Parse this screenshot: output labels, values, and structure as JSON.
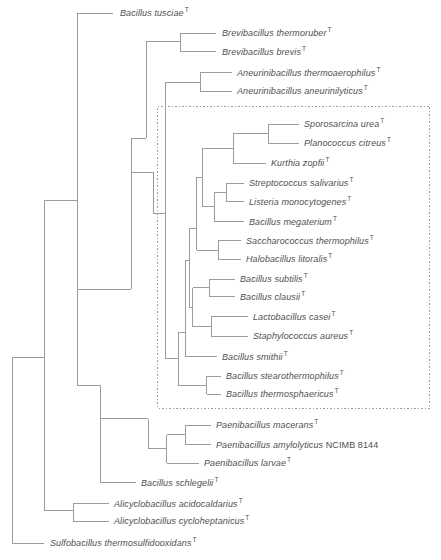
{
  "figure": {
    "colors": {
      "background": "#ffffff",
      "line": "#9c9c9c",
      "text": "#4f4f4f",
      "box_border": "#9c9c9c"
    },
    "highlight_box": {
      "x": 157.5,
      "y": 106,
      "width": 272,
      "height": 302,
      "style": "dotted"
    },
    "taxa": [
      {
        "label": "Bacillus tusciae",
        "type_marker": "T",
        "x": 120,
        "y": 13
      },
      {
        "label": "Brevibacillus thermoruber",
        "type_marker": "T",
        "x": 222,
        "y": 33
      },
      {
        "label": "Brevibacillus brevis",
        "type_marker": "T",
        "x": 222,
        "y": 51.7
      },
      {
        "label": "Aneurinibacillus thermoaerophilus",
        "type_marker": "T",
        "x": 237,
        "y": 72.7
      },
      {
        "label": "Aneurinibacillus aneurinilyticus",
        "type_marker": "T",
        "x": 237,
        "y": 91
      },
      {
        "label": "Sporosarcina urea",
        "type_marker": "T",
        "x": 304,
        "y": 124
      },
      {
        "label": "Planococcus citreus",
        "type_marker": "T",
        "x": 304,
        "y": 143
      },
      {
        "label": "Kurthia zopfii",
        "type_marker": "T",
        "x": 271,
        "y": 163
      },
      {
        "label": "Streptococcus salivarius",
        "type_marker": "T",
        "x": 249,
        "y": 183
      },
      {
        "label": "Listeria monocytogenes",
        "type_marker": "T",
        "x": 249,
        "y": 201.7
      },
      {
        "label": "Bacillus megaterium",
        "type_marker": "T",
        "x": 249,
        "y": 221.7
      },
      {
        "label": "Saccharococcus thermophilus",
        "type_marker": "T",
        "x": 246,
        "y": 240.7
      },
      {
        "label": "Halobacillus litoralis",
        "type_marker": "T",
        "x": 246,
        "y": 259.3
      },
      {
        "label": "Bacillus subtilis",
        "type_marker": "T",
        "x": 240,
        "y": 279
      },
      {
        "label": "Bacillus clausii",
        "type_marker": "T",
        "x": 240,
        "y": 296.7
      },
      {
        "label": "Lactobacillus casei",
        "type_marker": "T",
        "x": 253,
        "y": 316.7
      },
      {
        "label": "Staphylococcus aureus",
        "type_marker": "T",
        "x": 253,
        "y": 336
      },
      {
        "label": "Bacillus smithii",
        "type_marker": "T",
        "x": 222,
        "y": 356.7
      },
      {
        "label": "Bacillus stearothermophilus",
        "type_marker": "T",
        "x": 226,
        "y": 376
      },
      {
        "label": "Bacillus thermosphaericus",
        "type_marker": "T",
        "x": 226,
        "y": 394
      },
      {
        "label": "Paenibacillus macerans",
        "type_marker": "T",
        "x": 216,
        "y": 425
      },
      {
        "label": "Paenibacillus amylolyticus",
        "strain": "NCIMB 8144",
        "type_marker": "",
        "x": 216,
        "y": 444.7
      },
      {
        "label": "Paenibacillus larvae",
        "type_marker": "T",
        "x": 204,
        "y": 463
      },
      {
        "label": "Bacillus schlegelii",
        "type_marker": "T",
        "x": 141,
        "y": 482.7
      },
      {
        "label": "Alicyclobacillus acidocaldarius",
        "type_marker": "T",
        "x": 114,
        "y": 503.7
      },
      {
        "label": "Alicyclobacillus cycloheptanicus",
        "type_marker": "T",
        "x": 114,
        "y": 521
      },
      {
        "label": "Sulfobacillus thermosulfidooxidans",
        "type_marker": "T",
        "x": 50,
        "y": 543
      }
    ],
    "tree": {
      "verticals": [
        {
          "x": 12,
          "y1": 357.5,
          "y2": 543
        },
        {
          "x": 44,
          "y1": 200,
          "y2": 510.5
        },
        {
          "x": 77,
          "y1": 13,
          "y2": 385.3
        },
        {
          "x": 180,
          "y1": 33,
          "y2": 51.7
        },
        {
          "x": 146,
          "y1": 41,
          "y2": 138
        },
        {
          "x": 131,
          "y1": 138,
          "y2": 289
        },
        {
          "x": 153.3,
          "y1": 172,
          "y2": 213.3
        },
        {
          "x": 200,
          "y1": 72.7,
          "y2": 91
        },
        {
          "x": 165,
          "y1": 82,
          "y2": 358.7
        },
        {
          "x": 268,
          "y1": 124,
          "y2": 143
        },
        {
          "x": 233,
          "y1": 133.5,
          "y2": 163
        },
        {
          "x": 202.7,
          "y1": 148.3,
          "y2": 206.7
        },
        {
          "x": 226.7,
          "y1": 183,
          "y2": 201.7
        },
        {
          "x": 214.7,
          "y1": 192.3,
          "y2": 221.7
        },
        {
          "x": 196.5,
          "y1": 177.3,
          "y2": 250
        },
        {
          "x": 218.3,
          "y1": 240.7,
          "y2": 259.3
        },
        {
          "x": 189,
          "y1": 228.3,
          "y2": 307.3
        },
        {
          "x": 209.7,
          "y1": 279,
          "y2": 296.7
        },
        {
          "x": 192.5,
          "y1": 287.7,
          "y2": 326.7
        },
        {
          "x": 211.3,
          "y1": 316.7,
          "y2": 336
        },
        {
          "x": 185,
          "y1": 260,
          "y2": 356.7
        },
        {
          "x": 178.3,
          "y1": 332,
          "y2": 385
        },
        {
          "x": 206.7,
          "y1": 376,
          "y2": 394
        },
        {
          "x": 100,
          "y1": 385.3,
          "y2": 482.7
        },
        {
          "x": 148.3,
          "y1": 418.7,
          "y2": 448.7
        },
        {
          "x": 166.7,
          "y1": 434.7,
          "y2": 463
        },
        {
          "x": 185,
          "y1": 425,
          "y2": 444.7
        },
        {
          "x": 73,
          "y1": 503.7,
          "y2": 521
        }
      ],
      "horizontals": [
        {
          "y": 13,
          "x1": 77,
          "x2": 113
        },
        {
          "y": 200,
          "x1": 44,
          "x2": 77
        },
        {
          "y": 357.5,
          "x1": 12,
          "x2": 44
        },
        {
          "y": 543,
          "x1": 12,
          "x2": 44
        },
        {
          "y": 510.5,
          "x1": 44,
          "x2": 73
        },
        {
          "y": 503.7,
          "x1": 73,
          "x2": 109
        },
        {
          "y": 521,
          "x1": 73,
          "x2": 109
        },
        {
          "y": 41,
          "x1": 146,
          "x2": 180
        },
        {
          "y": 33,
          "x1": 180,
          "x2": 216
        },
        {
          "y": 51.7,
          "x1": 180,
          "x2": 216
        },
        {
          "y": 138,
          "x1": 131,
          "x2": 146
        },
        {
          "y": 289,
          "x1": 77,
          "x2": 131
        },
        {
          "y": 172,
          "x1": 131,
          "x2": 153.3
        },
        {
          "y": 213.3,
          "x1": 153.3,
          "x2": 165
        },
        {
          "y": 82,
          "x1": 165,
          "x2": 200
        },
        {
          "y": 72.7,
          "x1": 200,
          "x2": 232
        },
        {
          "y": 91,
          "x1": 200,
          "x2": 232
        },
        {
          "y": 358.7,
          "x1": 165,
          "x2": 178.3
        },
        {
          "y": 124,
          "x1": 268,
          "x2": 299
        },
        {
          "y": 143,
          "x1": 268,
          "x2": 299
        },
        {
          "y": 133.5,
          "x1": 233,
          "x2": 268
        },
        {
          "y": 163,
          "x1": 233,
          "x2": 266
        },
        {
          "y": 148.3,
          "x1": 202.7,
          "x2": 233
        },
        {
          "y": 183,
          "x1": 226.7,
          "x2": 244
        },
        {
          "y": 201.7,
          "x1": 226.7,
          "x2": 244
        },
        {
          "y": 192.3,
          "x1": 214.7,
          "x2": 226.7
        },
        {
          "y": 221.7,
          "x1": 214.7,
          "x2": 244
        },
        {
          "y": 206.7,
          "x1": 202.7,
          "x2": 214.7
        },
        {
          "y": 177.3,
          "x1": 196.5,
          "x2": 202.7
        },
        {
          "y": 240.7,
          "x1": 218.3,
          "x2": 241
        },
        {
          "y": 259.3,
          "x1": 218.3,
          "x2": 241
        },
        {
          "y": 250,
          "x1": 196.5,
          "x2": 218.3
        },
        {
          "y": 228.3,
          "x1": 189,
          "x2": 196.5
        },
        {
          "y": 279,
          "x1": 209.7,
          "x2": 235
        },
        {
          "y": 296.7,
          "x1": 209.7,
          "x2": 235
        },
        {
          "y": 287.7,
          "x1": 192.5,
          "x2": 209.7
        },
        {
          "y": 316.7,
          "x1": 211.3,
          "x2": 248
        },
        {
          "y": 336,
          "x1": 211.3,
          "x2": 248
        },
        {
          "y": 326.7,
          "x1": 192.5,
          "x2": 211.3
        },
        {
          "y": 307.3,
          "x1": 189,
          "x2": 192.5
        },
        {
          "y": 260,
          "x1": 185,
          "x2": 189
        },
        {
          "y": 356.7,
          "x1": 185,
          "x2": 217
        },
        {
          "y": 332,
          "x1": 178.3,
          "x2": 185
        },
        {
          "y": 376,
          "x1": 206.7,
          "x2": 221
        },
        {
          "y": 394,
          "x1": 206.7,
          "x2": 221
        },
        {
          "y": 385,
          "x1": 178.3,
          "x2": 206.7
        },
        {
          "y": 385.3,
          "x1": 77,
          "x2": 100
        },
        {
          "y": 482.7,
          "x1": 100,
          "x2": 136
        },
        {
          "y": 418.7,
          "x1": 100,
          "x2": 148.3
        },
        {
          "y": 448.7,
          "x1": 148.3,
          "x2": 166.7
        },
        {
          "y": 425,
          "x1": 185,
          "x2": 211
        },
        {
          "y": 444.7,
          "x1": 185,
          "x2": 211
        },
        {
          "y": 434.7,
          "x1": 166.7,
          "x2": 185
        },
        {
          "y": 463,
          "x1": 166.7,
          "x2": 199
        }
      ]
    }
  }
}
